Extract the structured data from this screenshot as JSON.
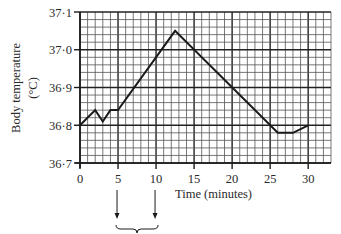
{
  "chart_data": {
    "type": "line",
    "title": "",
    "xlabel": "Time (minutes)",
    "ylabel": "Body temperature",
    "ylabel_unit": "(°C)",
    "xlim": [
      0,
      33
    ],
    "ylim": [
      36.7,
      37.1
    ],
    "x_ticks": [
      0,
      5,
      10,
      15,
      20,
      25,
      30
    ],
    "x_tick_labels": [
      "0",
      "5",
      "10",
      "15",
      "20",
      "25",
      "30"
    ],
    "y_ticks": [
      36.7,
      36.8,
      36.9,
      37.0,
      37.1
    ],
    "y_tick_labels": [
      "36·7",
      "36·8",
      "36·9",
      "37·0",
      "37·1"
    ],
    "grid": {
      "on": true,
      "minor_x_step": 1,
      "minor_y_step": 0.02,
      "major_x_step": 5,
      "major_y_step": 0.1
    },
    "legend": null,
    "series": [
      {
        "name": "Body temperature",
        "x": [
          0,
          2,
          3,
          4,
          5,
          12.5,
          26,
          28,
          30
        ],
        "y": [
          36.8,
          36.84,
          36.81,
          36.84,
          36.84,
          37.05,
          36.78,
          36.78,
          36.8
        ]
      }
    ],
    "annotations": [
      {
        "type": "arrow",
        "x": 5,
        "direction": "down"
      },
      {
        "type": "arrow",
        "x": 10,
        "direction": "down"
      },
      {
        "type": "brace",
        "from_x": 5,
        "to_x": 10
      }
    ]
  },
  "colors": {
    "line": "#1a1a1a",
    "grid_minor": "#555555",
    "grid_major": "#222222",
    "background": "#ffffff"
  }
}
